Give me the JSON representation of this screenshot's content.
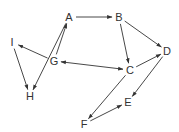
{
  "diagram": {
    "type": "directed-graph",
    "colors": {
      "stroke": "#333333",
      "text": "#333333",
      "background": "#ffffff"
    },
    "nodes": [
      {
        "id": "A",
        "label": "A",
        "x": 69,
        "y": 17
      },
      {
        "id": "B",
        "label": "B",
        "x": 119,
        "y": 17
      },
      {
        "id": "C",
        "label": "C",
        "x": 130,
        "y": 70
      },
      {
        "id": "D",
        "label": "D",
        "x": 167,
        "y": 51
      },
      {
        "id": "E",
        "label": "E",
        "x": 128,
        "y": 102
      },
      {
        "id": "F",
        "label": "F",
        "x": 84,
        "y": 124
      },
      {
        "id": "G",
        "label": "G",
        "x": 54,
        "y": 61
      },
      {
        "id": "H",
        "label": "H",
        "x": 30,
        "y": 96
      },
      {
        "id": "I",
        "label": "I",
        "x": 12,
        "y": 42
      }
    ],
    "edges": [
      {
        "from": "A",
        "to": "B",
        "bidirectional": false
      },
      {
        "from": "B",
        "to": "C",
        "bidirectional": false
      },
      {
        "from": "B",
        "to": "D",
        "bidirectional": false
      },
      {
        "from": "G",
        "to": "A",
        "bidirectional": false
      },
      {
        "from": "A",
        "to": "H",
        "bidirectional": false
      },
      {
        "from": "G",
        "to": "I",
        "bidirectional": false
      },
      {
        "from": "I",
        "to": "H",
        "bidirectional": false
      },
      {
        "from": "G",
        "to": "C",
        "bidirectional": true
      },
      {
        "from": "C",
        "to": "D",
        "bidirectional": false
      },
      {
        "from": "C",
        "to": "F",
        "bidirectional": false
      },
      {
        "from": "D",
        "to": "E",
        "bidirectional": false
      },
      {
        "from": "F",
        "to": "E",
        "bidirectional": false
      }
    ]
  }
}
